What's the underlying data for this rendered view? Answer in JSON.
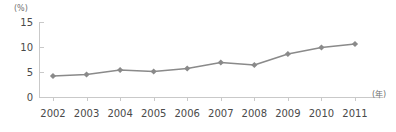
{
  "chart_data": {
    "type": "line",
    "title": "",
    "subtitle": "",
    "xlabel": "(年)",
    "ylabel": "(%)",
    "categories": [
      "2002",
      "2003",
      "2004",
      "2005",
      "2006",
      "2007",
      "2008",
      "2009",
      "2010",
      "2011"
    ],
    "values": [
      4.2,
      4.5,
      5.4,
      5.1,
      5.7,
      6.9,
      6.4,
      8.6,
      9.9,
      10.6
    ],
    "series": [
      {
        "name": "",
        "values": [
          4.2,
          4.5,
          5.4,
          5.1,
          5.7,
          6.9,
          6.4,
          8.6,
          9.9,
          10.6
        ]
      }
    ],
    "ylim": [
      0,
      15
    ],
    "yticks": [
      0,
      5,
      10,
      15
    ],
    "ytick_labels": [
      "0",
      "5",
      "10",
      "15"
    ],
    "grid": false,
    "legend": "none",
    "marker": "diamond",
    "line_color": "#8a8a8a",
    "marker_color": "#8a8a8a",
    "axis_color": "#c9c9c9",
    "text_color": "#4a4a4a"
  }
}
